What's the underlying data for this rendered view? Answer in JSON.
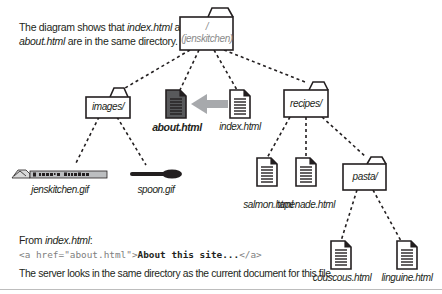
{
  "caption": {
    "prefix": "The diagram shows that ",
    "file1": "index.html",
    "middle": " and",
    "file2": "about.html",
    "suffix": " are in the same directory."
  },
  "tree": {
    "root": {
      "line1": "/",
      "line2": "(jenskitchen)"
    },
    "folders": {
      "images": "images/",
      "recipes": "recipes/",
      "pasta": "pasta/"
    },
    "files": {
      "about": "about.html",
      "index": "index.html",
      "jenskitchen_gif": "jenskitchen.gif",
      "spoon_gif": "spoon.gif",
      "salmon": "salmon.html",
      "tapenade": "tapenade.html",
      "couscous": "couscous.html",
      "linguine": "linguine.html"
    },
    "logo_text": "Jen's Kitchen"
  },
  "example": {
    "from_prefix": "From ",
    "from_file": "index.html",
    "from_suffix": ":",
    "code_open": "<a href=\"about.html\">",
    "code_text": "About this site...",
    "code_close": "</a>",
    "explanation": "The server looks in the same directory as the current document for this file."
  },
  "colors": {
    "arrow": "#a7a9ac",
    "selected_doc": "#58595b",
    "dotted_line": "#231f20",
    "root_label": "#8a8a8a"
  }
}
